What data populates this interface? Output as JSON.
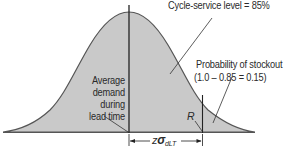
{
  "diagram": {
    "type": "normal-distribution",
    "colors": {
      "fill": "#c9c9c9",
      "stroke": "#555555",
      "line": "#222222",
      "text": "#2a2a2a"
    },
    "labels": {
      "cycle_service_level": "Cycle-service level = 85%",
      "stockout_title": "Probability of stockout",
      "stockout_formula": "(1.0 – 0.85 = 0.15)",
      "average_line1": "Average",
      "average_line2": "demand",
      "average_line3": "during",
      "average_line4": "lead time",
      "reorder_point": "R",
      "z_prefix": "z",
      "sigma": "σ",
      "sigma_sub": "dLT"
    }
  }
}
